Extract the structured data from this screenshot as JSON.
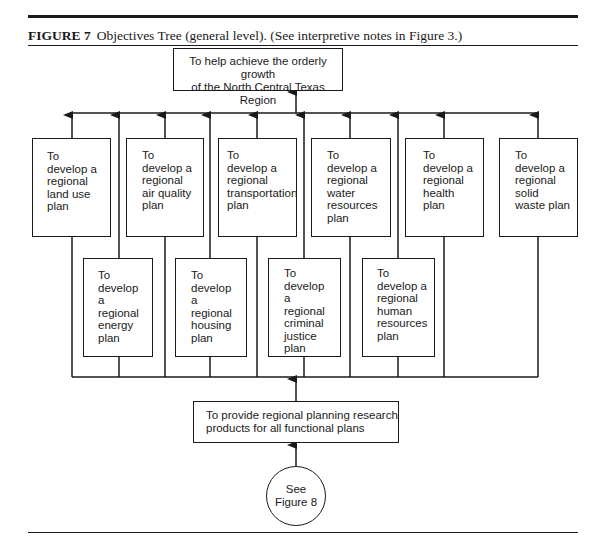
{
  "caption": {
    "figure_number": "FIGURE 7",
    "title": "Objectives Tree (general level). (See interpretive notes in Figure 3.)"
  },
  "goal": {
    "line1": "To help achieve the orderly growth",
    "line2": "of the North Central Texas Region"
  },
  "top_row": [
    {
      "lines": [
        "To",
        "develop a",
        "regional",
        "land use",
        "plan"
      ]
    },
    {
      "lines": [
        "To",
        "develop a",
        "regional",
        "air quality",
        "plan"
      ]
    },
    {
      "lines": [
        "To",
        "develop a",
        "regional",
        "transportation",
        "plan"
      ]
    },
    {
      "lines": [
        "To",
        "develop a",
        "regional",
        "water",
        "resources",
        "plan"
      ]
    },
    {
      "lines": [
        "To",
        "develop a",
        "regional",
        "health",
        "plan"
      ]
    },
    {
      "lines": [
        "To",
        "develop a",
        "regional",
        "solid",
        "waste plan"
      ]
    }
  ],
  "bottom_row": [
    {
      "lines": [
        "To",
        "develop",
        "a",
        "regional",
        "energy",
        "plan"
      ]
    },
    {
      "lines": [
        "To",
        "develop",
        "a",
        "regional",
        "housing",
        "plan"
      ]
    },
    {
      "lines": [
        "To",
        "develop",
        "a",
        "regional",
        "criminal",
        "justice",
        "plan"
      ]
    },
    {
      "lines": [
        "To",
        "develop a",
        "regional",
        "human",
        "resources",
        "plan"
      ]
    }
  ],
  "foundation": {
    "line1": "To provide regional planning research",
    "line2": "products for all functional plans"
  },
  "reference": {
    "line1": "See",
    "line2": "Figure 8"
  }
}
